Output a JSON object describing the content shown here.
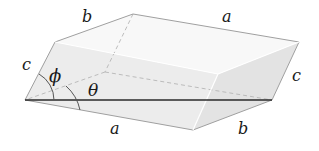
{
  "diagram": {
    "type": "parallelepiped",
    "colors": {
      "background": "#ffffff",
      "top_face": "#f7f7f7",
      "front_face": "#ececec",
      "left_face": "#e2e2e2",
      "right_face": "#e4e4e4",
      "edge": "#9a9a9a",
      "hidden_edge": "#b0b0b0",
      "axis_line": "#2a2a2a",
      "arc": "#555555"
    },
    "labels": {
      "top_b": "b",
      "top_a": "a",
      "left_c": "c",
      "right_c": "c",
      "bottom_a": "a",
      "bottom_b": "b",
      "phi": "ϕ",
      "theta": "θ"
    }
  }
}
